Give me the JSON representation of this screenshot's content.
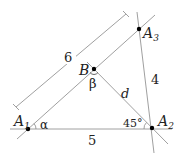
{
  "diagram": {
    "points": {
      "A1": {
        "label": "A",
        "sub": "1"
      },
      "A2": {
        "label": "A",
        "sub": "2"
      },
      "A3": {
        "label": "A",
        "sub": "3"
      },
      "B": {
        "label": "B"
      }
    },
    "lengths": {
      "A1A2": "5",
      "A2A3": "4",
      "A1A3": "6",
      "BA2": "d"
    },
    "angles": {
      "at_A1": "α",
      "at_B": "β",
      "at_A2": "45°"
    },
    "colors": {
      "line": "#9a9a9a",
      "point": "#000000",
      "text": "#222222"
    }
  }
}
